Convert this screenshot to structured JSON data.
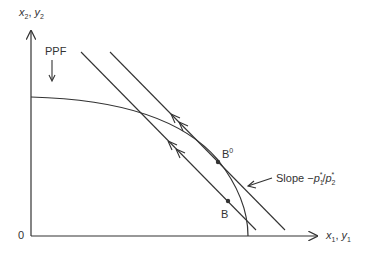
{
  "diagram": {
    "y_axis_label": {
      "var1": "x",
      "sub1": "2",
      "sep": ", ",
      "var2": "y",
      "sub2": "2"
    },
    "x_axis_label": {
      "var1": "x",
      "sub1": "1",
      "sep": ", ",
      "var2": "y",
      "sub2": "1"
    },
    "origin_label": "0",
    "ppf_label": "PPF",
    "point_b0": {
      "base": "B",
      "sup": "0"
    },
    "point_b": "B",
    "slope_label": {
      "prefix": "Slope −",
      "p1": "p",
      "p1_sub": "1",
      "p1_sup": "*",
      "slash": "/",
      "p2": "p",
      "p2_sub": "2",
      "p2_sup": "*"
    },
    "colors": {
      "line": "#333333",
      "background": "#ffffff"
    }
  }
}
